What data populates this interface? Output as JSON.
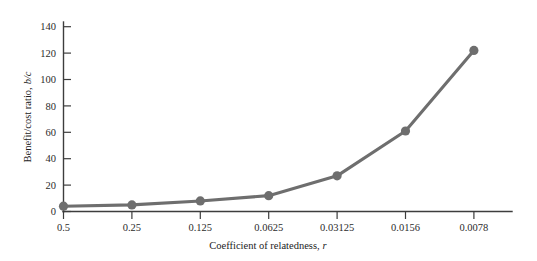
{
  "chart_data": {
    "type": "line",
    "title": "",
    "xlabel": "Coefficient of relatedness, r",
    "ylabel": "Benefit/cost ratio, b/c",
    "xlabel_plain": "Coefficient of relatedness,",
    "xlabel_italic": "r",
    "ylabel_plain": "Benefit/cost ratio,",
    "ylabel_italic": "b/c",
    "categories": [
      "0.5",
      "0.25",
      "0.125",
      "0.0625",
      "0.03125",
      "0.0156",
      "0.0078"
    ],
    "x_tick_labels": [
      "0.5",
      "0.25",
      "0.125",
      "0.0625",
      "0.03125",
      "0.0156",
      "0.0078"
    ],
    "y_tick_labels": [
      "0",
      "20",
      "40",
      "60",
      "80",
      "100",
      "120",
      "140"
    ],
    "y_ticks": [
      0,
      20,
      40,
      60,
      80,
      100,
      120,
      140
    ],
    "values": [
      4,
      5,
      8,
      12,
      27,
      61,
      122
    ],
    "series": [
      {
        "name": "benefit/cost ratio",
        "values": [
          4,
          5,
          8,
          12,
          27,
          61,
          122
        ],
        "color": "#6e6e6e",
        "marker": "circle"
      }
    ],
    "ylim": [
      0,
      148
    ],
    "xlim": [
      0,
      6.6
    ],
    "grid": false,
    "legend": "none",
    "axis_color": "#3d3d3d",
    "line_color": "#6e6e6e",
    "marker_color": "#6e6e6e",
    "background": "#ffffff"
  }
}
